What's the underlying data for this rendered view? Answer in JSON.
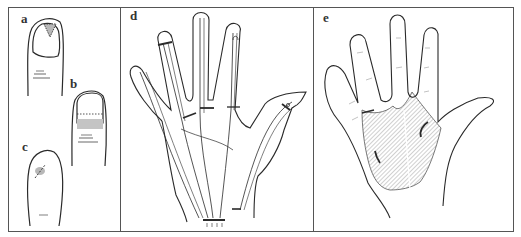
{
  "figure": {
    "panels": [
      {
        "id": "a",
        "label": "a",
        "description": "thumb nail with triangular shaded lesion at distal nail"
      },
      {
        "id": "b",
        "label": "b",
        "description": "fingernail with dotted transverse line and shaded proximal nail fold"
      },
      {
        "id": "c",
        "label": "c",
        "description": "fingertip pad with shaded lesion and dashed incision line"
      },
      {
        "id": "d",
        "label": "d",
        "description": "dorsal/volar hand showing tendon sheaths with incision markers"
      },
      {
        "id": "e",
        "label": "e",
        "description": "palm with hatched mid-palmar and thenar spaces and incision marks"
      }
    ],
    "colors": {
      "line": "#2a2a2a",
      "border": "#555555",
      "shading": "#b8b8b8",
      "hatch": "#8a8a8a",
      "background": "#ffffff"
    }
  }
}
